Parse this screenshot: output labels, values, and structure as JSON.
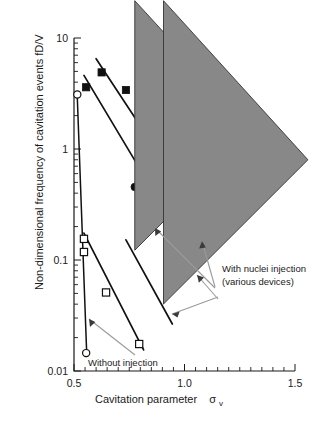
{
  "chart_data": {
    "type": "scatter",
    "title": "",
    "xlabel": "Cavitation parameter",
    "xlabel_symbol": "σ",
    "xlabel_subscript": "v",
    "ylabel": "Non-dimensional frequency of cavitation events  fD/V",
    "xscale": "linear",
    "yscale": "log",
    "xlim": [
      0.5,
      1.5
    ],
    "ylim": [
      0.01,
      10
    ],
    "grid": false,
    "legend_position": "inside-right-annotations",
    "xticks": [
      0.5,
      1.0,
      1.5
    ],
    "xtick_labels": [
      "0.5",
      "1.0",
      "1.5"
    ],
    "xticks_minor": [
      0.55,
      0.6,
      0.65,
      0.7,
      0.75,
      0.8,
      0.85,
      0.9,
      0.95,
      1.05,
      1.1,
      1.15,
      1.2,
      1.25,
      1.3,
      1.35,
      1.4,
      1.45
    ],
    "yticks": [
      0.01,
      0.1,
      1,
      10
    ],
    "ytick_labels": [
      "0.01",
      "0.1",
      "1",
      "10"
    ],
    "series": [
      {
        "name": "filled-squares-upper",
        "marker": "filled-square",
        "points": [
          [
            0.555,
            3.6
          ],
          [
            0.625,
            4.9
          ],
          [
            0.735,
            3.4
          ],
          [
            0.855,
            1.35
          ],
          [
            1.055,
            0.255
          ]
        ],
        "fit_line": {
          "x": [
            0.6,
            1.1
          ],
          "y": [
            6.5,
            0.2
          ]
        }
      },
      {
        "name": "filled-circles-middle",
        "marker": "filled-circle",
        "points": [
          [
            0.775,
            0.455
          ],
          [
            0.895,
            0.285
          ]
        ],
        "fit_line": {
          "x": [
            0.545,
            0.945
          ],
          "y": [
            4.6,
            0.215
          ]
        }
      },
      {
        "name": "open-squares-steep",
        "marker": "open-square",
        "points": [
          [
            0.545,
            0.155
          ],
          [
            0.545,
            0.118
          ],
          [
            0.645,
            0.051
          ],
          [
            0.795,
            0.0175
          ]
        ],
        "fit_line": {
          "x": [
            0.545,
            0.815
          ],
          "y": [
            0.175,
            0.0155
          ]
        }
      },
      {
        "name": "triangles-right",
        "marker": "triangle",
        "points": [
          [
            0.775,
            0.113
          ],
          [
            0.905,
            0.037
          ]
        ],
        "fit_line": {
          "x": [
            0.735,
            0.945
          ],
          "y": [
            0.152,
            0.0265
          ]
        }
      },
      {
        "name": "without-injection-open-circles",
        "marker": "open-circle",
        "points": [
          [
            0.515,
            3.1
          ],
          [
            0.555,
            0.0145
          ]
        ],
        "fit_line": {
          "x": [
            0.515,
            0.558
          ],
          "y": [
            2.9,
            0.0135
          ]
        }
      }
    ],
    "annotations": [
      {
        "name": "with-nuclei-injection",
        "line1": "With nuclei injection",
        "line2": "(various devices)",
        "text_x": 222,
        "text_y": 272
      },
      {
        "name": "without-injection",
        "text": "Without injection",
        "text_x": 88,
        "text_y": 363
      }
    ],
    "colors": {
      "marker_filled": "#111111",
      "marker_open_fill": "#ffffff",
      "marker_edge": "#111111",
      "fit_line": "#111111",
      "leader": "#9a9a9a",
      "axis": "#1a1a1a",
      "background": "#ffffff"
    }
  }
}
